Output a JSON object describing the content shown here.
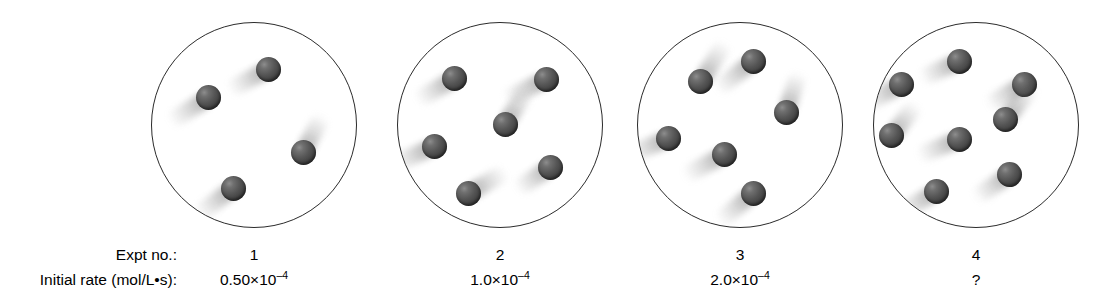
{
  "figure": {
    "type": "reaction-rate-particle-diagram",
    "background_color": "#ffffff",
    "vessel_outline_color": "#2b2b2b",
    "particle_color": "#4a4a4a",
    "trail_color": "#b4b4b4",
    "row_labels": {
      "expt": "Expt no.:",
      "rate": "Initial rate (mol/L•s):"
    },
    "vessels": [
      {
        "expt_no": "1",
        "rate_mantissa": "0.50×10",
        "rate_exponent": "–4",
        "rate_full": "0.50×10⁻⁴",
        "particle_count": 4,
        "center": {
          "x": 254,
          "y": 125
        },
        "radius": 103,
        "particles": [
          {
            "x": 0.565,
            "y": 0.225,
            "trail_len": 44,
            "trail_angle": -28
          },
          {
            "x": 0.275,
            "y": 0.36,
            "trail_len": 46,
            "trail_angle": -32
          },
          {
            "x": 0.395,
            "y": 0.805,
            "trail_len": 44,
            "trail_angle": -37
          },
          {
            "x": 0.735,
            "y": 0.63,
            "trail_len": 42,
            "trail_angle": 118
          }
        ]
      },
      {
        "expt_no": "2",
        "rate_mantissa": "1.0×10",
        "rate_exponent": "–4",
        "rate_full": "1.0×10⁻⁴",
        "particle_count": 6,
        "center": {
          "x": 500,
          "y": 125
        },
        "radius": 103,
        "particles": [
          {
            "x": 0.275,
            "y": 0.27,
            "trail_len": 44,
            "trail_angle": -30
          },
          {
            "x": 0.72,
            "y": 0.275,
            "trail_len": 46,
            "trail_angle": -26
          },
          {
            "x": 0.52,
            "y": 0.495,
            "trail_len": 44,
            "trail_angle": 122
          },
          {
            "x": 0.175,
            "y": 0.6,
            "trail_len": 46,
            "trail_angle": -24
          },
          {
            "x": 0.34,
            "y": 0.83,
            "trail_len": 44,
            "trail_angle": 150
          },
          {
            "x": 0.74,
            "y": 0.7,
            "trail_len": 40,
            "trail_angle": -34
          }
        ]
      },
      {
        "expt_no": "3",
        "rate_mantissa": "2.0×10",
        "rate_exponent": "–4",
        "rate_full": "2.0×10⁻⁴",
        "particle_count": 6,
        "center": {
          "x": 740,
          "y": 125
        },
        "radius": 103,
        "particles": [
          {
            "x": 0.56,
            "y": 0.185,
            "trail_len": 46,
            "trail_angle": -38
          },
          {
            "x": 0.305,
            "y": 0.285,
            "trail_len": 46,
            "trail_angle": 122
          },
          {
            "x": 0.15,
            "y": 0.56,
            "trail_len": 46,
            "trail_angle": -22
          },
          {
            "x": 0.72,
            "y": 0.435,
            "trail_len": 42,
            "trail_angle": 108
          },
          {
            "x": 0.42,
            "y": 0.64,
            "trail_len": 46,
            "trail_angle": -28
          },
          {
            "x": 0.56,
            "y": 0.83,
            "trail_len": 44,
            "trail_angle": -40
          }
        ]
      },
      {
        "expt_no": "4",
        "rate_mantissa": "?",
        "rate_exponent": "",
        "rate_full": "?",
        "particle_count": 8,
        "center": {
          "x": 976,
          "y": 125
        },
        "radius": 103,
        "particles": [
          {
            "x": 0.415,
            "y": 0.185,
            "trail_len": 42,
            "trail_angle": -24
          },
          {
            "x": 0.135,
            "y": 0.3,
            "trail_len": 44,
            "trail_angle": -28
          },
          {
            "x": 0.73,
            "y": 0.3,
            "trail_len": 42,
            "trail_angle": -30
          },
          {
            "x": 0.64,
            "y": 0.47,
            "trail_len": 44,
            "trail_angle": 128
          },
          {
            "x": 0.085,
            "y": 0.545,
            "trail_len": 40,
            "trail_angle": 128
          },
          {
            "x": 0.415,
            "y": 0.565,
            "trail_len": 44,
            "trail_angle": -22
          },
          {
            "x": 0.66,
            "y": 0.735,
            "trail_len": 42,
            "trail_angle": -34
          },
          {
            "x": 0.305,
            "y": 0.82,
            "trail_len": 44,
            "trail_angle": -30
          }
        ]
      }
    ]
  }
}
